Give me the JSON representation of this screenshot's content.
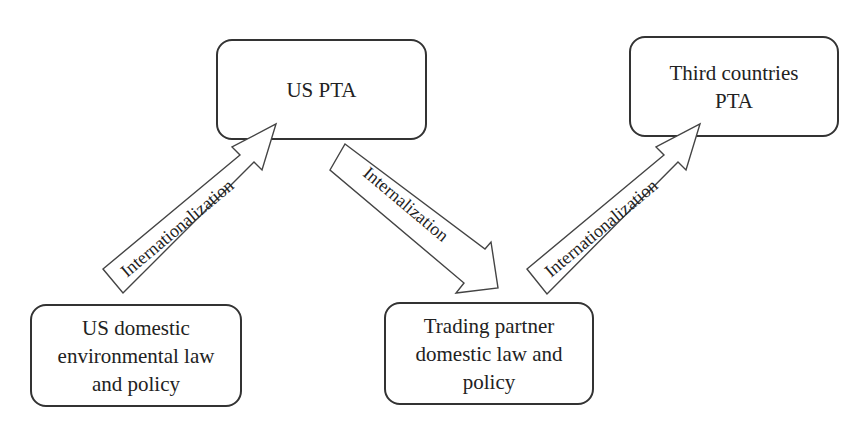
{
  "diagram": {
    "nodes": [
      {
        "id": "us_pta",
        "label": "US PTA"
      },
      {
        "id": "third_countries_pta",
        "label": "Third countries\nPTA"
      },
      {
        "id": "us_domestic",
        "label": "US domestic\nenvironmental law\nand policy"
      },
      {
        "id": "trading_partner",
        "label": "Trading partner\ndomestic law and\npolicy"
      }
    ],
    "edges": [
      {
        "from": "us_domestic",
        "to": "us_pta",
        "label": "Internationalization"
      },
      {
        "from": "us_pta",
        "to": "trading_partner",
        "label": "Internalization"
      },
      {
        "from": "trading_partner",
        "to": "third_countries_pta",
        "label": "Internationalization"
      }
    ]
  }
}
